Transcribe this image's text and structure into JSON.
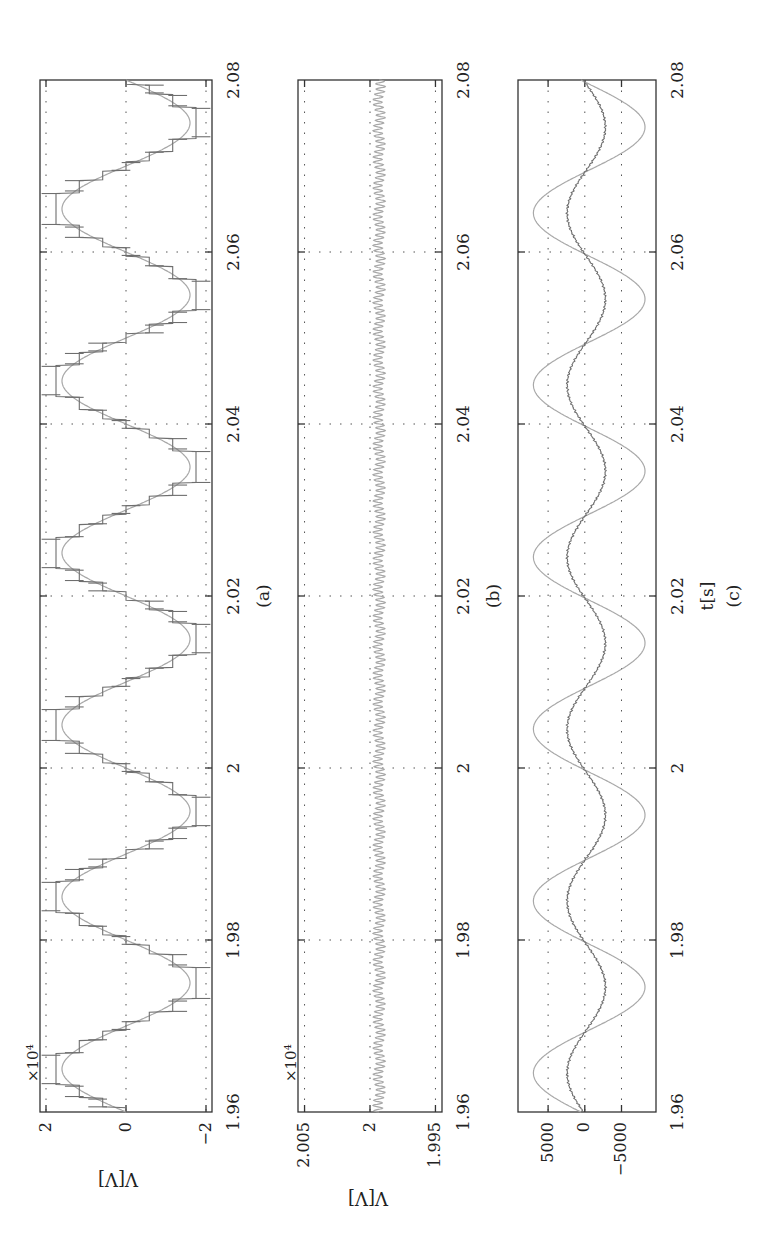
{
  "figure": {
    "orientation": "rotated 90 degrees counter-clockwise",
    "panels": [
      {
        "id": "a",
        "caption": "(a)",
        "ylabel": "V[V]",
        "exponent": "×10⁴",
        "yticks": [
          "2",
          "0",
          "−2"
        ],
        "xticks": [
          "1.96",
          "1.98",
          "2",
          "2.02",
          "2.04",
          "2.06",
          "2.08"
        ]
      },
      {
        "id": "b",
        "caption": "(b)",
        "ylabel": "V[V]",
        "exponent": "×10⁴",
        "yticks": [
          "2.005",
          "2",
          "1.995"
        ],
        "xticks": [
          "1.96",
          "1.98",
          "2",
          "2.02",
          "2.04",
          "2.06",
          "2.08"
        ]
      },
      {
        "id": "c",
        "caption": "(c)",
        "xlabel": "t[s]",
        "ylabel": "",
        "yticks": [
          "5000",
          "0",
          "−5000"
        ],
        "xticks": [
          "1.96",
          "1.98",
          "2",
          "2.02",
          "2.04",
          "2.06",
          "2.08"
        ]
      }
    ]
  },
  "chart_data": [
    {
      "type": "line",
      "title": "(a)",
      "xlabel": "",
      "ylabel": "V[V]",
      "y_scale_exponent": "×10^4",
      "xlim": [
        1.96,
        2.08
      ],
      "ylim": [
        -2,
        2
      ],
      "xticks": [
        1.96,
        1.98,
        2.0,
        2.02,
        2.04,
        2.06,
        2.08
      ],
      "yticks": [
        -2,
        0,
        2
      ],
      "grid": true,
      "series": [
        {
          "name": "multilevel staircase voltage",
          "style": "dark stepped with switching spikes",
          "frequency_hz": 50,
          "amplitude": 1.75,
          "levels": 7,
          "description": "Staircase approximation of 50 Hz sine, peaks ~±1.75e4 V with spikes to ~±2e4 V"
        },
        {
          "name": "fundamental",
          "style": "light smooth",
          "frequency_hz": 50,
          "amplitude": 1.6,
          "phase": "zero crossing rising at t=1.96"
        }
      ]
    },
    {
      "type": "line",
      "title": "(b)",
      "xlabel": "",
      "ylabel": "V[V]",
      "y_scale_exponent": "×10^4",
      "xlim": [
        1.96,
        2.08
      ],
      "ylim": [
        1.995,
        2.005
      ],
      "xticks": [
        1.96,
        1.98,
        2.0,
        2.02,
        2.04,
        2.06,
        2.08
      ],
      "yticks": [
        1.995,
        2.0,
        2.005
      ],
      "grid": true,
      "series": [
        {
          "name": "DC link voltage",
          "style": "light with ripple",
          "mean": 1.9993,
          "ripple_pp": 0.0008,
          "description": "Nearly constant ~2e4 V with small high-frequency ripple"
        }
      ]
    },
    {
      "type": "line",
      "title": "(c)",
      "xlabel": "t[s]",
      "ylabel": "",
      "xlim": [
        1.96,
        2.08
      ],
      "ylim": [
        -9000,
        9000
      ],
      "xticks": [
        1.96,
        1.98,
        2.0,
        2.02,
        2.04,
        2.06,
        2.08
      ],
      "yticks": [
        -5000,
        0,
        5000
      ],
      "grid": true,
      "series": [
        {
          "name": "large sinusoid",
          "style": "light smooth",
          "frequency_hz": 50,
          "amplitude": 7600,
          "description": "Amplitude ~7600, starts near 0 at 1.96 rising, positive peak ~1.965"
        },
        {
          "name": "small sinusoid",
          "style": "dark noisy",
          "frequency_hz": 50,
          "amplitude": 2600,
          "description": "Amplitude ~2600, in phase with large sinusoid, slight noise"
        }
      ]
    }
  ]
}
